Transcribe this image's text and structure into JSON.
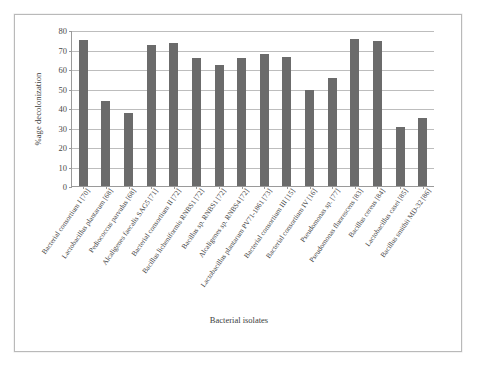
{
  "chart_data": {
    "type": "bar",
    "title": "",
    "xlabel": "Bacterial isolates",
    "ylabel": "%age decolonization",
    "ylim": [
      0,
      80
    ],
    "ytick_values": [
      0,
      10,
      20,
      30,
      40,
      50,
      60,
      70,
      80
    ],
    "ytick_labels": [
      "0",
      "10",
      "20",
      "30",
      "40",
      "50",
      "60",
      "70",
      "80"
    ],
    "grid": true,
    "legend": "none",
    "bar_color": "#6b6b6b",
    "categories": [
      "Bacterial consortium I [70]",
      "Lactobacillus plantarum [68]",
      "Pediococcus parvulus [68]",
      "Alcaligenes faecalis SAG5 [71]",
      "Bacterial consortium II [72]",
      "Bacillus licheniformis RNBS1 [72]",
      "Bacillus sp. RNBS1 [72]",
      "Alcaligenes sp. RNBS4 [72]",
      "Lactobacillus plantarum PV71-1861 [73]",
      "Bacterial consortium III [15]",
      "Bacterial consortium IV [16]",
      "Pseudomonas sp. [77]",
      "Pseudomonas fluorescens [83]",
      "Bacillus cereus [84]",
      "Lactobacillus casei [85]",
      "Bacillus smithii MD-32 [86]"
    ],
    "values": [
      75,
      43.5,
      37.5,
      72.3,
      73.3,
      65.5,
      62,
      65.5,
      67.5,
      66.3,
      49.3,
      55.2,
      75.5,
      74.3,
      30.5,
      34.8
    ]
  }
}
